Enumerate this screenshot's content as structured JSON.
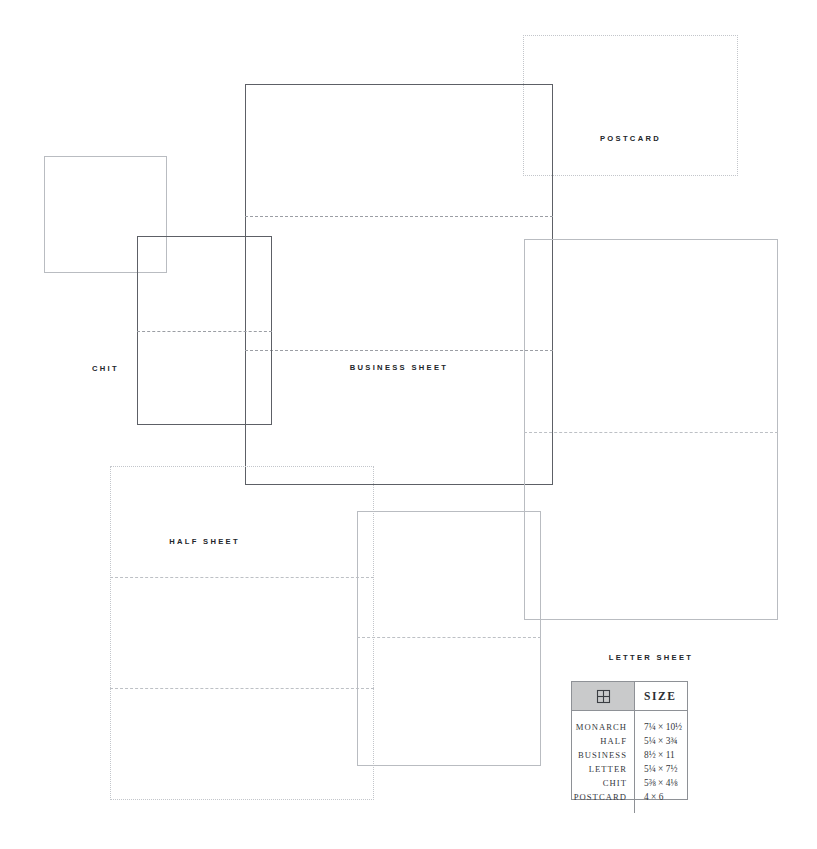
{
  "diagram": {
    "title_hidden": "",
    "background_color": "#ffffff",
    "stroke_dark": "#5d6066",
    "stroke_light": "#b9bcc1",
    "stroke_faint": "#c3c6cb",
    "fold_color": "#9b9ea4",
    "sheets": [
      {
        "id": "postcard",
        "label": "POSTCARD",
        "x": 523,
        "y": 35,
        "w": 215,
        "h": 141,
        "weight": "faint",
        "label_y": 99,
        "folds": []
      },
      {
        "id": "chit",
        "label": "CHIT",
        "x": 44,
        "y": 156,
        "w": 123,
        "h": 117,
        "weight": "light",
        "label_y": 208,
        "folds": []
      },
      {
        "id": "business-sheet",
        "label": "BUSINESS SHEET",
        "x": 245,
        "y": 84,
        "w": 308,
        "h": 401,
        "weight": "solid",
        "label_y": 279,
        "folds": [
          132,
          266
        ]
      },
      {
        "id": "half-sheet",
        "label": "HALF SHEET",
        "x": 137,
        "y": 236,
        "w": 135,
        "h": 189,
        "weight": "solid",
        "label_y": 301,
        "folds": [
          95
        ]
      },
      {
        "id": "letter-sheet",
        "label": "LETTER SHEET",
        "x": 524,
        "y": 239,
        "w": 254,
        "h": 381,
        "weight": "light",
        "label_y": 414,
        "folds": [
          193
        ]
      },
      {
        "id": "monarch-sheet",
        "label": "MONARCH SHEET",
        "x": 110,
        "y": 466,
        "w": 264,
        "h": 334,
        "weight": "faint",
        "label_y": 630,
        "folds": [
          111,
          222
        ]
      },
      {
        "id": "informal-note",
        "label": "INFORMAL NOTE",
        "x": 357,
        "y": 511,
        "w": 184,
        "h": 255,
        "weight": "light",
        "label_y": 573,
        "folds": [
          126
        ]
      }
    ]
  },
  "legend": {
    "x": 571,
    "y": 681,
    "w": 117,
    "h": 119,
    "header_icon": "grid-window-icon",
    "header_size_label": "SIZE",
    "header_bg": "#c9cacb",
    "rows": [
      {
        "name": "MONARCH",
        "size": "7¼ × 10½"
      },
      {
        "name": "HALF",
        "size": "5¼ × 3¾"
      },
      {
        "name": "BUSINESS",
        "size": "8½ × 11"
      },
      {
        "name": "LETTER",
        "size": "5¼ × 7½"
      },
      {
        "name": "CHIT",
        "size": "5⅜ × 4⅛"
      },
      {
        "name": "POSTCARD",
        "size": "4 × 6"
      }
    ]
  }
}
